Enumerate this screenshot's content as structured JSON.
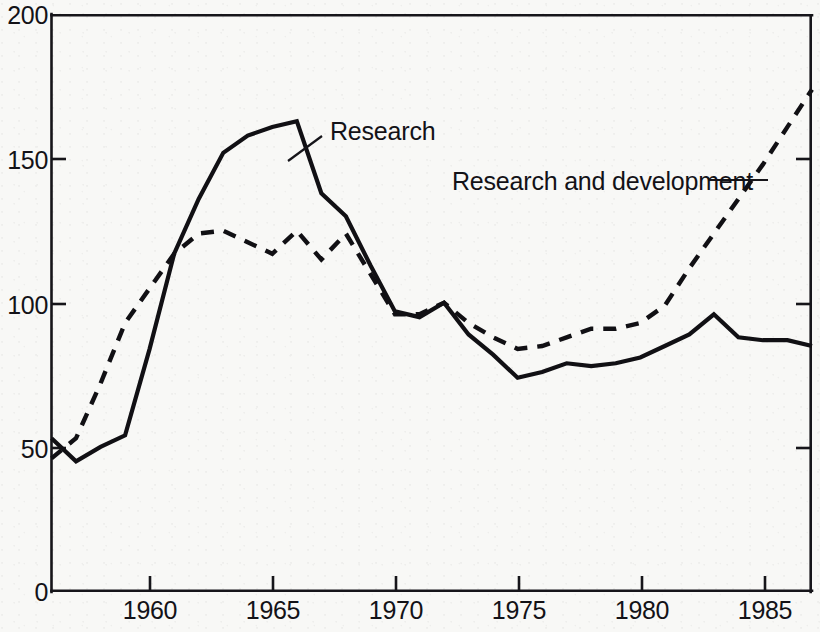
{
  "chart_data": {
    "type": "line",
    "title": "",
    "subtitle": "",
    "xlabel": "",
    "ylabel": "",
    "xlim": [
      1956,
      1987
    ],
    "ylim": [
      0,
      200
    ],
    "xticks": [
      1960,
      1965,
      1970,
      1975,
      1980,
      1985
    ],
    "yticks": [
      0,
      50,
      100,
      150,
      200
    ],
    "xtick_labels": [
      "1960",
      "1965",
      "1970",
      "1975",
      "1980",
      "1985"
    ],
    "ytick_labels": [
      "0",
      "50",
      "100",
      "150",
      "200"
    ],
    "grid": false,
    "legend_position": "inline-annotation",
    "x": [
      1956,
      1957,
      1958,
      1959,
      1960,
      1961,
      1962,
      1963,
      1964,
      1965,
      1966,
      1967,
      1968,
      1969,
      1970,
      1971,
      1972,
      1973,
      1974,
      1975,
      1976,
      1977,
      1978,
      1979,
      1980,
      1981,
      1982,
      1983,
      1984,
      1985,
      1986,
      1987
    ],
    "series": [
      {
        "name": "Research",
        "style": "solid",
        "values": [
          53,
          45,
          50,
          54,
          84,
          117,
          136,
          152,
          158,
          161,
          163,
          138,
          130,
          113,
          97,
          95,
          100,
          89,
          82,
          74,
          76,
          79,
          78,
          79,
          81,
          85,
          89,
          96,
          88,
          87,
          87,
          85
        ]
      },
      {
        "name": "Research and development",
        "style": "dashed",
        "values": [
          46,
          53,
          72,
          93,
          105,
          117,
          124,
          125,
          121,
          117,
          125,
          115,
          124,
          110,
          96,
          96,
          100,
          93,
          88,
          84,
          85,
          88,
          91,
          91,
          93,
          99,
          112,
          124,
          136,
          148,
          161,
          174
        ]
      }
    ],
    "annotations": [
      {
        "text": "Research",
        "x_pos": 330,
        "y_pos": 117,
        "leader_from": [
          322,
          136
        ],
        "leader_to": [
          287,
          160
        ]
      },
      {
        "text": "Research and development",
        "x_pos": 452,
        "y_pos": 167,
        "leader_from": [
          706,
          181
        ],
        "leader_to": [
          762,
          181
        ]
      }
    ]
  },
  "axes": {
    "y_tick_labels": [
      {
        "value": "200",
        "y": 14
      },
      {
        "value": "150",
        "y": 159
      },
      {
        "value": "100",
        "y": 304
      },
      {
        "value": "50",
        "y": 448
      },
      {
        "value": "0",
        "y": 592
      }
    ],
    "x_tick_labels": [
      {
        "value": "1960",
        "x": 150
      },
      {
        "value": "1965",
        "x": 273
      },
      {
        "value": "1970",
        "x": 396
      },
      {
        "value": "1975",
        "x": 519
      },
      {
        "value": "1980",
        "x": 642
      },
      {
        "value": "1985",
        "x": 765
      }
    ]
  },
  "colors": {
    "ink": "#111014",
    "paper": "#f8f8f6"
  }
}
